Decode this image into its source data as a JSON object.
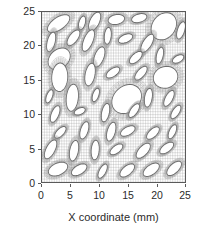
{
  "figure": {
    "kind": "finite-element-mesh-plot",
    "background": "#ffffff",
    "frame_color": "#5a5a5a",
    "mesh_color": "#8c8c8c",
    "void_fill": "#ffffff",
    "inclusion_outline": "#6e6e6e"
  },
  "chart_data": {
    "type": "scatter",
    "title": "",
    "subtitle": "",
    "xlabel": "X coordinate (mm)",
    "ylabel": "Y coordinate (mm)",
    "xlim": [
      0,
      25
    ],
    "ylim": [
      0,
      25
    ],
    "xticks": [
      0,
      5,
      10,
      15,
      20,
      25
    ],
    "yticks": [
      0,
      5,
      10,
      15,
      20,
      25
    ],
    "xticklabels": [
      "0",
      "5",
      "10",
      "15",
      "20",
      "25"
    ],
    "yticklabels": [
      "0",
      "5",
      "10",
      "15",
      "20",
      "25"
    ],
    "grid": false,
    "legend": null,
    "annotations": [],
    "mesh": {
      "element_type": "quadrilateral",
      "domain": {
        "x0": 0,
        "y0": 0,
        "x1": 25,
        "y1": 25
      },
      "background_grid_divisions": 58
    },
    "series": [
      {
        "name": "elliptical voids",
        "units": "mm",
        "count": 52,
        "fields": [
          "cx",
          "cy",
          "a",
          "b",
          "angle_deg"
        ],
        "values": [
          [
            2.9,
            23.3,
            2.15,
            0.95,
            28
          ],
          [
            7.0,
            23.4,
            1.05,
            0.55,
            70
          ],
          [
            9.2,
            23.6,
            1.55,
            0.8,
            58
          ],
          [
            13.0,
            23.9,
            1.45,
            0.72,
            8
          ],
          [
            17.0,
            24.1,
            1.35,
            0.62,
            12
          ],
          [
            21.3,
            22.9,
            2.35,
            1.85,
            32
          ],
          [
            24.3,
            22.3,
            1.35,
            0.62,
            68
          ],
          [
            1.6,
            20.6,
            1.5,
            0.68,
            72
          ],
          [
            5.5,
            21.2,
            1.45,
            0.7,
            46
          ],
          [
            8.1,
            20.8,
            1.75,
            0.78,
            62
          ],
          [
            11.5,
            21.5,
            1.25,
            0.6,
            82
          ],
          [
            14.6,
            21.1,
            1.3,
            0.6,
            18
          ],
          [
            18.4,
            20.4,
            1.6,
            0.72,
            52
          ],
          [
            3.0,
            18.1,
            2.05,
            1.45,
            28
          ],
          [
            10.0,
            18.4,
            1.6,
            0.8,
            64
          ],
          [
            16.4,
            18.3,
            1.3,
            0.62,
            35
          ],
          [
            20.6,
            18.6,
            1.25,
            0.58,
            74
          ],
          [
            23.8,
            18.1,
            1.05,
            0.52,
            22
          ],
          [
            3.1,
            15.4,
            2.1,
            1.4,
            86
          ],
          [
            8.4,
            15.8,
            1.7,
            0.85,
            76
          ],
          [
            12.4,
            16.1,
            1.3,
            0.6,
            28
          ],
          [
            17.3,
            16.0,
            1.35,
            0.62,
            42
          ],
          [
            21.6,
            15.4,
            2.15,
            1.6,
            8
          ],
          [
            1.3,
            12.6,
            1.05,
            0.5,
            64
          ],
          [
            5.3,
            12.4,
            2.0,
            1.05,
            82
          ],
          [
            9.4,
            12.8,
            1.05,
            0.52,
            66
          ],
          [
            14.8,
            12.2,
            2.7,
            2.0,
            24
          ],
          [
            18.6,
            12.4,
            1.4,
            0.66,
            78
          ],
          [
            22.2,
            12.3,
            1.35,
            0.62,
            56
          ],
          [
            2.3,
            10.0,
            1.35,
            0.64,
            62
          ],
          [
            6.6,
            10.4,
            1.0,
            0.48,
            18
          ],
          [
            11.1,
            10.2,
            1.4,
            0.66,
            74
          ],
          [
            16.1,
            10.5,
            1.25,
            0.58,
            48
          ],
          [
            23.4,
            10.3,
            1.2,
            0.56,
            50
          ],
          [
            3.2,
            7.3,
            1.2,
            0.56,
            38
          ],
          [
            7.4,
            7.6,
            1.35,
            0.66,
            68
          ],
          [
            12.1,
            7.4,
            1.45,
            0.7,
            70
          ],
          [
            15.0,
            7.5,
            1.35,
            0.62,
            22
          ],
          [
            19.4,
            7.2,
            1.3,
            0.62,
            36
          ],
          [
            22.8,
            7.4,
            1.15,
            0.55,
            60
          ],
          [
            1.5,
            4.8,
            1.6,
            0.75,
            56
          ],
          [
            5.6,
            4.6,
            1.55,
            0.75,
            76
          ],
          [
            9.3,
            4.7,
            1.45,
            0.7,
            84
          ],
          [
            13.0,
            4.8,
            1.25,
            0.58,
            30
          ],
          [
            17.7,
            4.6,
            1.5,
            0.72,
            40
          ],
          [
            21.8,
            5.0,
            1.35,
            0.62,
            30
          ],
          [
            2.8,
            1.9,
            1.75,
            0.9,
            18
          ],
          [
            6.5,
            1.8,
            1.45,
            0.7,
            24
          ],
          [
            10.6,
            1.6,
            1.2,
            0.56,
            56
          ],
          [
            14.9,
            1.7,
            1.45,
            0.7,
            32
          ],
          [
            19.1,
            1.8,
            1.55,
            0.75,
            28
          ],
          [
            23.1,
            2.0,
            1.5,
            0.72,
            36
          ]
        ]
      }
    ]
  }
}
